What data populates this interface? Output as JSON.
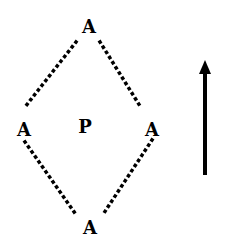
{
  "diagram": {
    "nodes": [
      {
        "id": "top",
        "label": "A",
        "x": 89,
        "y": 27
      },
      {
        "id": "left",
        "label": "A",
        "x": 24,
        "y": 130
      },
      {
        "id": "center",
        "label": "P",
        "x": 85,
        "y": 127
      },
      {
        "id": "right",
        "label": "A",
        "x": 152,
        "y": 130
      },
      {
        "id": "bottom",
        "label": "A",
        "x": 90,
        "y": 228
      }
    ],
    "edges": [
      {
        "from": "top",
        "to": "left",
        "style": "dotted"
      },
      {
        "from": "top",
        "to": "right",
        "style": "dotted"
      },
      {
        "from": "left",
        "to": "bottom",
        "style": "dotted"
      },
      {
        "from": "right",
        "to": "bottom",
        "style": "dotted"
      }
    ],
    "arrow": {
      "direction": "up",
      "x": 205,
      "y_tip": 60,
      "y_tail": 175
    },
    "colors": {
      "ink": "#000000",
      "background": "#ffffff"
    }
  }
}
